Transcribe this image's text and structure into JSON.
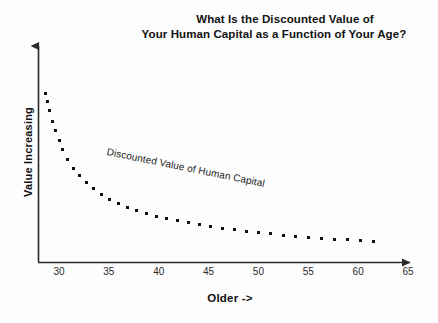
{
  "chart_data": {
    "type": "line",
    "style": "dotted",
    "title": "What Is the Discounted Value of Your Human Capital as a Function of Your Age?",
    "title_lines": [
      "What Is the Discounted Value of",
      "Your Human Capital as a Function of Your Age?"
    ],
    "xlabel": "Older ->",
    "ylabel": "Value Increasing",
    "xlim": [
      28,
      65
    ],
    "ylim": [
      0,
      100
    ],
    "grid": false,
    "legend": "none",
    "x_tick_labels": [
      "30",
      "35",
      "40",
      "45",
      "50",
      "55",
      "60",
      "65"
    ],
    "x_ticks": [
      30,
      35,
      40,
      45,
      50,
      55,
      60,
      65
    ],
    "y_tick_labels": [],
    "annotations": [
      {
        "text": "Discounted Value of Human Capital",
        "x": 36,
        "y": 56,
        "rotation_deg": 11.5
      }
    ],
    "series": [
      {
        "name": "Discounted Value of Human Capital",
        "x": [
          28.6,
          28.8,
          29.0,
          29.3,
          29.6,
          30.0,
          30.4,
          30.9,
          31.5,
          32.1,
          32.8,
          33.5,
          34.3,
          35.1,
          36.0,
          36.9,
          37.8,
          38.8,
          39.8,
          40.8,
          41.9,
          43.0,
          44.1,
          45.2,
          46.4,
          47.6,
          48.8,
          50.0,
          51.2,
          52.5,
          53.7,
          55.0,
          56.3,
          57.6,
          58.9,
          60.2,
          61.5
        ],
        "y": [
          97.0,
          92.0,
          87.0,
          81.0,
          75.5,
          70.0,
          64.5,
          59.0,
          54.0,
          49.5,
          45.5,
          42.0,
          39.0,
          36.2,
          33.8,
          31.6,
          29.7,
          28.0,
          26.4,
          25.0,
          23.7,
          22.5,
          21.4,
          20.4,
          19.4,
          18.5,
          17.7,
          16.9,
          16.2,
          15.5,
          14.9,
          14.3,
          13.7,
          13.2,
          12.7,
          12.2,
          11.8
        ]
      }
    ],
    "colors": {
      "data": "#111111",
      "axis": "#2a2a2a",
      "background": "#fdfdfd",
      "text": "#111111"
    }
  },
  "axes": {
    "y_arrow_tip_label": "value-increasing-arrow",
    "x_arrow_tip_label": "older-arrow"
  }
}
